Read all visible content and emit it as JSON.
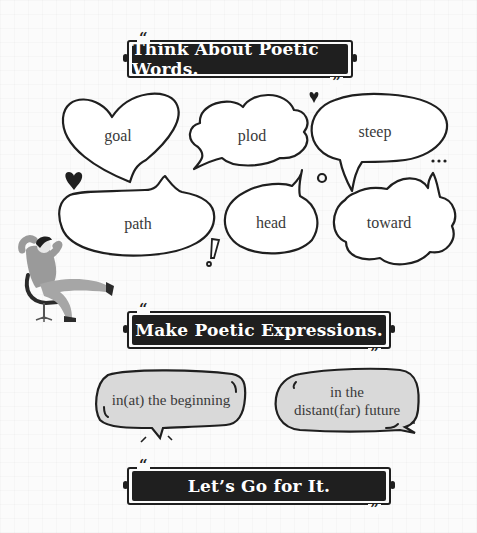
{
  "sections": [
    {
      "title": "Think About Poetic Words.",
      "open_quote": "“",
      "close_quote": "”"
    },
    {
      "title": "Make Poetic Expressions.",
      "open_quote": "“",
      "close_quote": "”"
    },
    {
      "title": "Let’s Go for It.",
      "open_quote": "“",
      "close_quote": "”"
    }
  ],
  "words": [
    {
      "text": "goal",
      "shape": "heart"
    },
    {
      "text": "plod",
      "shape": "cloud"
    },
    {
      "text": "steep",
      "shape": "oval"
    },
    {
      "text": "path",
      "shape": "bean"
    },
    {
      "text": "head",
      "shape": "oval"
    },
    {
      "text": "toward",
      "shape": "cloud"
    }
  ],
  "expressions": [
    {
      "text": "in(at) the beginning"
    },
    {
      "line1": "in the",
      "line2": "distant(far) future"
    }
  ],
  "decorations": [
    "heart-icon",
    "heart-icon",
    "circle-icon",
    "ellipsis-icon",
    "exclamation-icon",
    "person-reclining-illustration"
  ],
  "colors": {
    "ink": "#1f1f1f",
    "bubble_fill": "#ffffff",
    "expression_fill": "#d9d9d9",
    "banner_text": "#ffffff"
  }
}
